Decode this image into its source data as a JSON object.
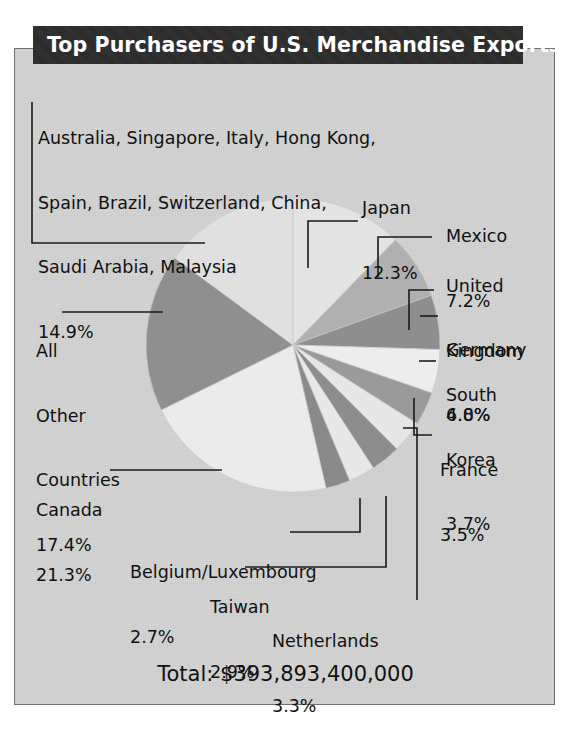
{
  "title": "Top Purchasers of U.S. Merchandise Exports",
  "total_label": "Total: $393,893,400,000",
  "colors": {
    "title_bar_bg": "#2b2b2b",
    "title_text": "#ffffff",
    "panel_bg": "#d4d4d4",
    "frame_border": "#6f6f6f",
    "label_text": "#111111",
    "leader_line": "#1a1a1a"
  },
  "labels": {
    "group_other_named": {
      "line1": "Australia, Singapore, Italy, Hong Kong,",
      "line2": "Spain, Brazil, Switzerland, China,",
      "line3": "Saudi Arabia, Malaysia",
      "line4": "14.9%"
    },
    "japan": {
      "name": "Japan",
      "pct": "12.3%"
    },
    "mexico": {
      "name": "Mexico",
      "pct": "7.2%"
    },
    "united_kingdom": {
      "line1": "United",
      "line2": "Kingdom",
      "pct": "6.0%"
    },
    "germany": {
      "name": "Germany",
      "pct": "4.8%"
    },
    "south_korea": {
      "line1": "South",
      "line2": "Korea",
      "pct": "3.7%"
    },
    "france": {
      "name": "France",
      "pct": "3.5%"
    },
    "netherlands": {
      "name": "Netherlands",
      "pct": "3.3%"
    },
    "taiwan": {
      "name": "Taiwan",
      "pct": "2.9%"
    },
    "belgium_luxembourg": {
      "name": "Belgium/Luxembourg",
      "pct": "2.7%"
    },
    "canada": {
      "name": "Canada",
      "pct": "21.3%"
    },
    "all_other_countries": {
      "line1": "All",
      "line2": "Other",
      "line3": "Countries",
      "pct": "17.4%"
    }
  },
  "chart_data": {
    "type": "pie",
    "title": "Top Purchasers of U.S. Merchandise Exports",
    "unit": "percent of total U.S. merchandise exports",
    "total": "$393,893,400,000",
    "legend_position": "callout-labels",
    "start_angle_deg": 0,
    "direction": "clockwise",
    "categories": [
      "Japan",
      "Mexico",
      "United Kingdom",
      "Germany",
      "South Korea",
      "France",
      "Netherlands",
      "Taiwan",
      "Belgium/Luxembourg",
      "Canada",
      "All Other Countries",
      "Australia, Singapore, Italy, Hong Kong, Spain, Brazil, Switzerland, China, Saudi Arabia, Malaysia"
    ],
    "values": [
      12.3,
      7.2,
      6.0,
      4.8,
      3.7,
      3.5,
      3.3,
      2.9,
      2.7,
      21.3,
      17.4,
      14.9
    ],
    "slice_colors": [
      "#e3e3e3",
      "#b0b0b0",
      "#8e8e8e",
      "#ededed",
      "#9a9a9a",
      "#e6e6e6",
      "#8d8d8d",
      "#e8e8e8",
      "#8a8a8a",
      "#ebebeb",
      "#8f8f8f",
      "#e0e0e0"
    ]
  }
}
